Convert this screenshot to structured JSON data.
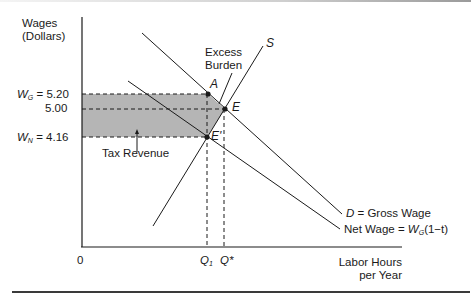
{
  "axes": {
    "y_label_line1": "Wages",
    "y_label_line2": "(Dollars)",
    "x_label_line1": "Labor Hours",
    "x_label_line2": "per Year",
    "origin": "0"
  },
  "y_ticks": {
    "wg_symbol": "W",
    "wg_sub": "G",
    "wg_value": "= 5.20",
    "mid_value": "5.00",
    "wn_symbol": "W",
    "wn_sub": "N",
    "wn_value": "= 4.16"
  },
  "x_ticks": {
    "q1_symbol": "Q",
    "q1_sub": "1",
    "qstar": "Q*"
  },
  "points": {
    "A": "A",
    "E": "E",
    "E_prime": "E'"
  },
  "curves": {
    "supply": "S",
    "demand_symbol": "D",
    "demand_label": "= Gross Wage",
    "net_label_prefix": "Net Wage = ",
    "net_symbol": "W",
    "net_sub": "G",
    "net_label_suffix": "(1−t)"
  },
  "annotations": {
    "excess_burden_line1": "Excess",
    "excess_burden_line2": "Burden",
    "tax_revenue": "Tax Revenue"
  },
  "colors": {
    "shade": "#b5b5b5",
    "line": "#1a1a1a"
  },
  "values": {
    "wage_gross": 5.2,
    "wage_equilibrium": 5.0,
    "wage_net": 4.16
  }
}
